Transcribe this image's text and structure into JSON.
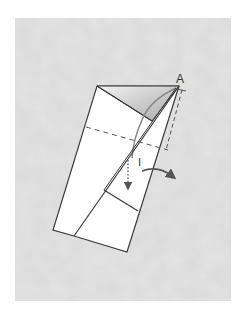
{
  "diagram": {
    "type": "origami-fold-step",
    "background_color": "#e6e6e6",
    "paper_color": "#ffffff",
    "line_color": "#3a3a3a",
    "shade_color": "#bdbdbd",
    "arrow_color": "#555555",
    "labels": {
      "point": "A",
      "step_mark": "I"
    }
  }
}
